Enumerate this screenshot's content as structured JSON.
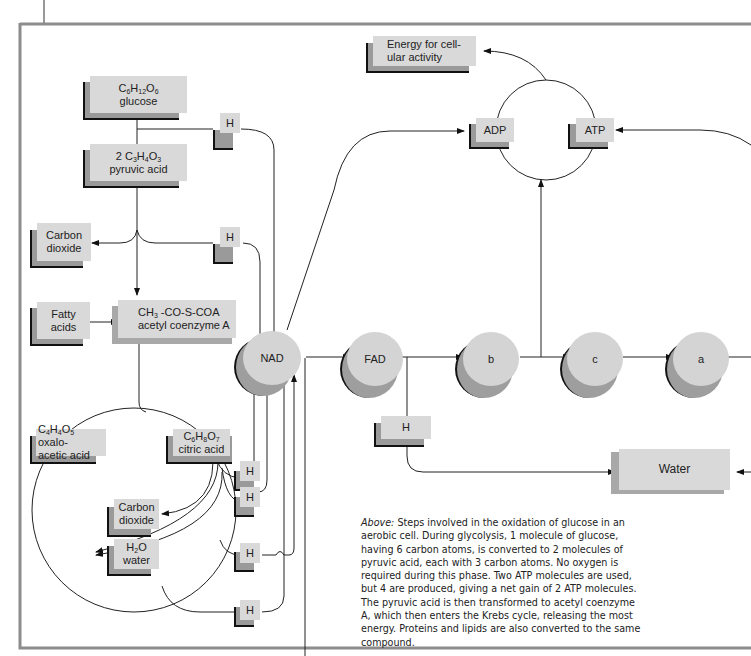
{
  "figure": {
    "type": "metabolic-pathway-diagram",
    "subject": "Oxidation of glucose in an aerobic cell"
  },
  "nodes": {
    "glucose": {
      "formula_parts": [
        "C",
        "6",
        "H",
        "12",
        "O",
        "6"
      ],
      "label": "glucose"
    },
    "pyruvic_acid": {
      "formula_prefix": "2 ",
      "formula_parts": [
        "C",
        "3",
        "H",
        "4",
        "O",
        "3"
      ],
      "label": "pyruvic acid"
    },
    "carbon_dioxide_top": {
      "line1": "Carbon",
      "line2": "dioxide"
    },
    "fatty_acids": {
      "line1": "Fatty",
      "line2": "acids"
    },
    "acetyl_coa": {
      "formula_a": "CH",
      "formula_sub": "3",
      "formula_b": " -CO-S-COA",
      "label": "acetyl coenzyme A"
    },
    "oxaloacetic_acid": {
      "formula_parts": [
        "C",
        "4",
        "H",
        "4",
        "O",
        "5"
      ],
      "suffix": " oxalo-",
      "label": "acetic acid"
    },
    "citric_acid": {
      "formula_parts": [
        "C",
        "6",
        "H",
        "8",
        "O",
        "7"
      ],
      "label": "citric acid"
    },
    "carbon_dioxide_cycle": {
      "line1": "Carbon",
      "line2": "dioxide"
    },
    "water_cycle": {
      "formula_a": "H",
      "formula_sub": "2",
      "formula_b": "O",
      "label": "water"
    },
    "energy": {
      "line1": "Energy for cell-",
      "line2": "ular activity"
    },
    "adp": {
      "label": "ADP"
    },
    "atp": {
      "label": "ATP"
    },
    "nad": {
      "label": "NAD"
    },
    "fad": {
      "label": "FAD"
    },
    "cyt_b": {
      "label": "b"
    },
    "cyt_c": {
      "label": "c"
    },
    "cyt_a": {
      "label": "a"
    },
    "water_final": {
      "label": "Water"
    },
    "hydrogen_label": "H"
  },
  "hydrogen_markers": [
    {
      "id": "h-glycolysis",
      "label": "H"
    },
    {
      "id": "h-pyruvate",
      "label": "H"
    },
    {
      "id": "h-cycle-1",
      "label": "H"
    },
    {
      "id": "h-cycle-2",
      "label": "H"
    },
    {
      "id": "h-cycle-3",
      "label": "H"
    },
    {
      "id": "h-cycle-4",
      "label": "H"
    },
    {
      "id": "h-fad",
      "label": "H"
    }
  ],
  "caption": {
    "lead": "Above:",
    "body": " Steps involved in the oxidation of glucose in an aerobic cell. During glycolysis, 1 molecule of glucose, having 6 carbon atoms, is converted to 2 molecules of pyruvic acid, each with 3 carbon atoms. No oxygen is required during this phase. Two ATP molecules are used, but 4 are produced, giving a net gain of 2 ATP molecules. The pyruvic acid is then transformed to acetyl coenzyme A, which then enters the Krebs cycle, releasing the most energy. Proteins and lipids are also converted to the same compound."
  },
  "colors": {
    "box_fill": "#d9d9d9",
    "box_shadow": "#9a9a9a",
    "line": "#222222",
    "frame": "#8c8c8c"
  }
}
